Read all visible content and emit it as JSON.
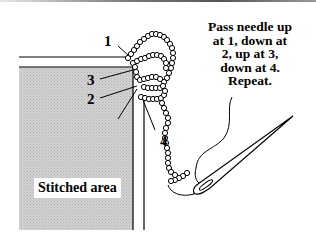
{
  "diagram": {
    "instructions": [
      "Pass needle up",
      "at 1, down at",
      "2, up at 3,",
      "down at 4.",
      "Repeat."
    ],
    "labels": {
      "point_1": "1",
      "point_2": "2",
      "point_3": "3",
      "point_4": "4",
      "stitched_area": "Stitched area"
    },
    "colors": {
      "fabric_fill": "#c8c8c8",
      "outline": "#000000",
      "background": "#ffffff"
    }
  }
}
